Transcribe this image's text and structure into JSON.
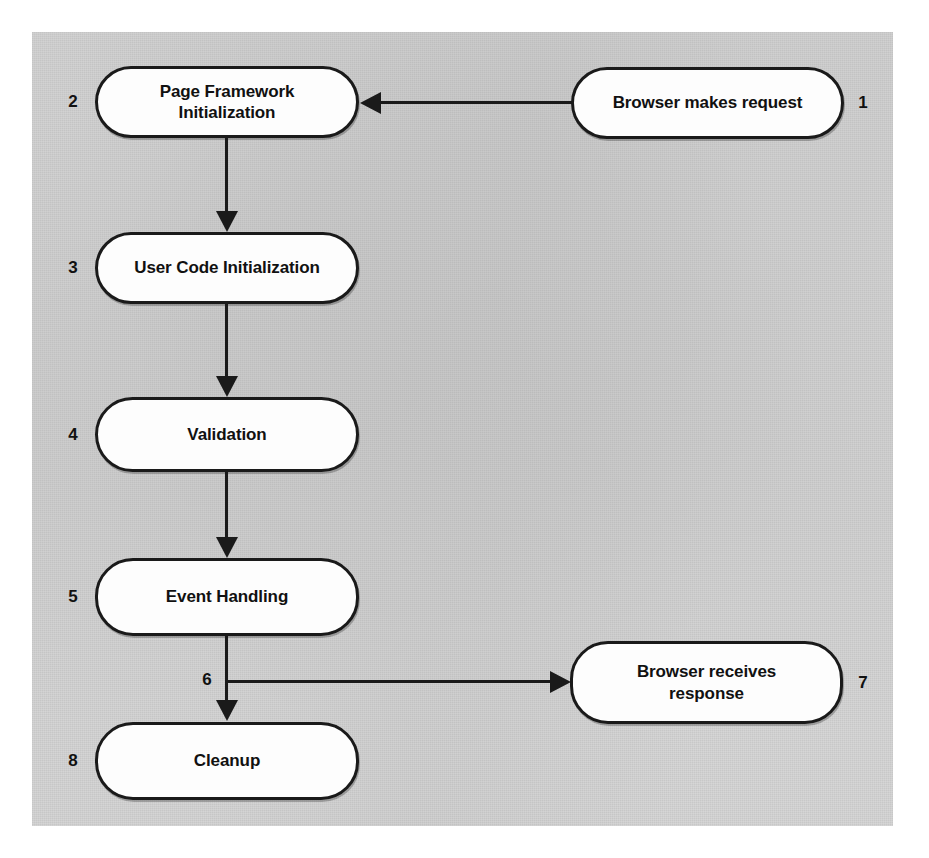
{
  "diagram": {
    "panel": {
      "background_color": "#d5d5d5",
      "page_background_color": "#ffffff"
    },
    "colors": {
      "node_fill": "#fdfdfd",
      "node_border": "#1a1a1a",
      "connector": "#1a1a1a",
      "text": "#111111"
    },
    "nodes": [
      {
        "id": "n1",
        "number": "1",
        "label": "Browser makes request",
        "number_side": "right"
      },
      {
        "id": "n2",
        "number": "2",
        "label": "Page Framework Initialization",
        "number_side": "left"
      },
      {
        "id": "n3",
        "number": "3",
        "label": "User Code Initialization",
        "number_side": "left"
      },
      {
        "id": "n4",
        "number": "4",
        "label": "Validation",
        "number_side": "left"
      },
      {
        "id": "n5",
        "number": "5",
        "label": "Event Handling",
        "number_side": "left"
      },
      {
        "id": "n7",
        "number": "7",
        "label": "Browser receives\nresponse",
        "label_line1": "Browser receives",
        "label_line2": "response",
        "number_side": "right"
      },
      {
        "id": "n8",
        "number": "8",
        "label": "Cleanup",
        "number_side": "left"
      }
    ],
    "branch_labels": [
      {
        "id": "b6",
        "number": "6"
      }
    ],
    "connectors": [
      {
        "from": "n1",
        "to": "n2",
        "direction": "left"
      },
      {
        "from": "n2",
        "to": "n3",
        "direction": "down"
      },
      {
        "from": "n3",
        "to": "n4",
        "direction": "down"
      },
      {
        "from": "n4",
        "to": "n5",
        "direction": "down"
      },
      {
        "from": "n5",
        "to": "n8",
        "direction": "down"
      },
      {
        "from": "n5",
        "to": "n7",
        "direction": "right"
      }
    ]
  }
}
